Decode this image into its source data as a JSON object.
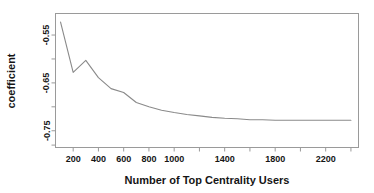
{
  "chart_data": {
    "type": "line",
    "title": "",
    "xlabel": "Number of Top Centrality Users",
    "ylabel": "coefficient",
    "xlim": [
      60,
      2460
    ],
    "ylim": [
      -0.785,
      -0.505
    ],
    "grid": false,
    "legend": null,
    "x_ticks": [
      200,
      400,
      600,
      800,
      1000,
      1200,
      1400,
      1600,
      1800,
      2000,
      2200,
      2400
    ],
    "x_tick_labels": [
      "200",
      "400",
      "600",
      "800",
      "1000",
      "",
      "1400",
      "",
      "1800",
      "",
      "2200",
      ""
    ],
    "y_ticks": [
      -0.55,
      -0.6,
      -0.65,
      -0.7,
      -0.75,
      -0.78
    ],
    "y_tick_labels": [
      "-0.55",
      "",
      "-0.65",
      "",
      "-0.75",
      ""
    ],
    "series": [
      {
        "name": "coefficient",
        "x": [
          100,
          200,
          300,
          400,
          500,
          600,
          700,
          800,
          900,
          1000,
          1100,
          1200,
          1300,
          1400,
          1500,
          1600,
          1700,
          1800,
          1900,
          2000,
          2100,
          2200,
          2300,
          2400
        ],
        "values": [
          -0.523,
          -0.628,
          -0.603,
          -0.639,
          -0.662,
          -0.67,
          -0.691,
          -0.7,
          -0.707,
          -0.712,
          -0.716,
          -0.719,
          -0.722,
          -0.724,
          -0.725,
          -0.727,
          -0.727,
          -0.728,
          -0.728,
          -0.728,
          -0.728,
          -0.728,
          -0.728,
          -0.728
        ]
      }
    ]
  },
  "axes": {
    "x_title": "Number of Top Centrality Users",
    "y_title": "coefficient"
  },
  "colors": {
    "line": "#8a8a8a",
    "frame": "#9a9a9a",
    "text": "#151515",
    "background": "#ffffff"
  }
}
